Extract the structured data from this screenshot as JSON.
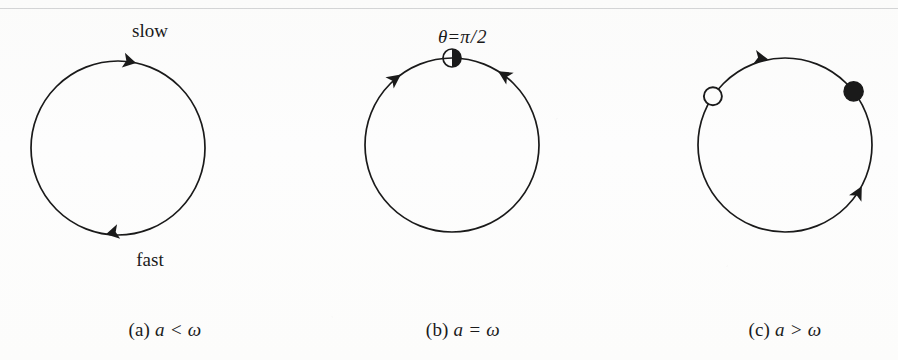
{
  "figure": {
    "background_color": "#fdfdfc",
    "ink_color": "#1a1a1a"
  },
  "panels": [
    {
      "id": "a",
      "caption_mark": "(a)",
      "caption_expr": "a < ω",
      "labels": {
        "top": "slow",
        "bottom": "fast"
      },
      "circle": {
        "cx": 118,
        "cy": 148,
        "r": 87
      },
      "arrows": [
        {
          "name": "arrowhead-top-clockwise",
          "angle_deg": 78,
          "direction": "clockwise"
        },
        {
          "name": "arrowhead-bottom-clockwise",
          "angle_deg": 262,
          "direction": "clockwise"
        }
      ],
      "markers": []
    },
    {
      "id": "b",
      "caption_mark": "(b)",
      "caption_expr": "a = ω",
      "labels": {
        "theta_symbol": "θ",
        "theta_equals": "=",
        "theta_value_num": "π",
        "theta_slash": "/",
        "theta_value_den": "2",
        "theta_full": "θ = π/2"
      },
      "circle": {
        "cx": 154,
        "cy": 145,
        "r": 87
      },
      "arrows": [
        {
          "name": "arrowhead-left-counterclockwise",
          "angle_deg": 126,
          "direction": "toward-top"
        },
        {
          "name": "arrowhead-right-clockwise",
          "angle_deg": 58,
          "direction": "toward-top"
        }
      ],
      "markers": [
        {
          "name": "half-filled-fixed-point",
          "angle_deg": 90,
          "style": "half-filled",
          "radius": 9
        }
      ]
    },
    {
      "id": "c",
      "caption_mark": "(c)",
      "caption_expr": "a > ω",
      "labels": {},
      "circle": {
        "cx": 165,
        "cy": 145,
        "r": 87
      },
      "arrows": [
        {
          "name": "arrowhead-top-clockwise",
          "angle_deg": 101,
          "direction": "clockwise"
        },
        {
          "name": "arrowhead-lower-right-counterclockwise",
          "angle_deg": 332,
          "direction": "counterclockwise"
        }
      ],
      "markers": [
        {
          "name": "unstable-fixed-point",
          "angle_deg": 146,
          "style": "open",
          "radius": 9
        },
        {
          "name": "stable-fixed-point",
          "angle_deg": 38,
          "style": "filled",
          "radius": 9
        }
      ]
    }
  ]
}
